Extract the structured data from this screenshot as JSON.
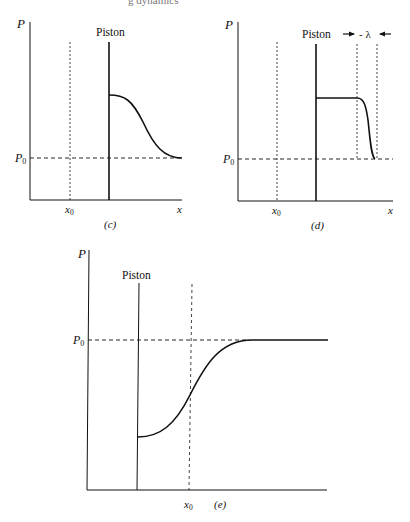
{
  "header_fragment": "g dynamics",
  "panels": [
    {
      "id": "c",
      "caption": "(c)",
      "y_axis_label": "P",
      "x_axis_label": "x",
      "ref_pressure_label": "P",
      "ref_pressure_sub": "0",
      "ref_position_label": "x",
      "ref_position_sub": "0",
      "piston_label": "Piston",
      "description": "Pressure pulse ahead of piston smoothly decaying to P0"
    },
    {
      "id": "d",
      "caption": "(d)",
      "y_axis_label": "P",
      "x_axis_label": "x",
      "ref_pressure_label": "P",
      "ref_pressure_sub": "0",
      "ref_position_label": "x",
      "ref_position_sub": "0",
      "piston_label": "Piston",
      "width_label": "- λ",
      "description": "Steepened pressure front of width λ ahead of piston"
    },
    {
      "id": "e",
      "caption": "(e)",
      "y_axis_label": "P",
      "ref_pressure_label": "P",
      "ref_pressure_sub": "0",
      "ref_position_label": "x",
      "ref_position_sub": "0",
      "piston_label": "Piston",
      "description": "Rarefaction: pressure rises from low value at piston to P0"
    }
  ]
}
